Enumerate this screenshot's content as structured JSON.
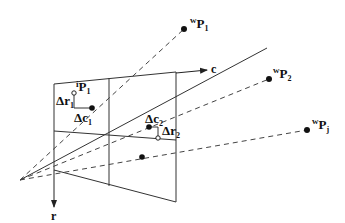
{
  "diagram": {
    "axes": {
      "column_label": "c",
      "row_label": "r"
    },
    "world_points": [
      {
        "id": "wP1",
        "superscript": "w",
        "base": "P",
        "subscript": "1"
      },
      {
        "id": "wP2",
        "superscript": "w",
        "base": "P",
        "subscript": "2"
      },
      {
        "id": "wPj",
        "superscript": "w",
        "base": "P",
        "subscript": "j"
      }
    ],
    "image_points": [
      {
        "id": "iP1",
        "superscript": "i",
        "base": "P",
        "subscript": "1"
      }
    ],
    "offsets": [
      {
        "id": "dr1",
        "prefix": "Δr",
        "subscript": "1"
      },
      {
        "id": "dc1",
        "prefix": "Δc",
        "subscript": "1"
      },
      {
        "id": "dc2",
        "prefix": "Δc",
        "subscript": "2"
      },
      {
        "id": "dr2",
        "prefix": "Δr",
        "subscript": "2"
      }
    ],
    "colors": {
      "line": "#333333",
      "background": "#ffffff"
    }
  }
}
